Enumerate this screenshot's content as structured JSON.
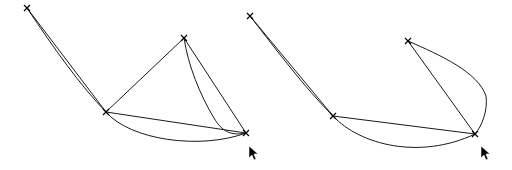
{
  "canvas": {
    "width": 512,
    "height": 170,
    "background": "#ffffff",
    "stroke_color": "#1a1a1a"
  },
  "panels": [
    {
      "id": "left",
      "control_points": [
        [
          27,
          8
        ],
        [
          106,
          112
        ],
        [
          184,
          38
        ],
        [
          246,
          133
        ]
      ],
      "curve_path": "M27,8 C55,50 80,85 106,112 C130,140 200,150 246,133 C232,136 222,132 214,118 C200,95 188,65 184,38",
      "cursor": [
        249,
        146
      ]
    },
    {
      "id": "right",
      "control_points": [
        [
          250,
          16
        ],
        [
          333,
          116
        ],
        [
          408,
          41
        ],
        [
          475,
          134
        ]
      ],
      "curve_path": "M250,16 C278,52 305,88 333,116 C360,145 420,160 475,134 C482,126 488,110 486,96 C478,72 440,55 408,41",
      "cursor": [
        481,
        148
      ]
    }
  ]
}
